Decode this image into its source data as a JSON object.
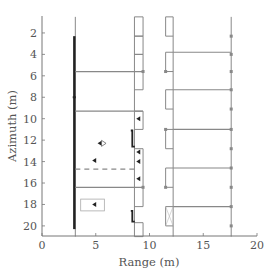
{
  "chart_data": {
    "type": "diagram",
    "title": "",
    "xlabel": "Range (m)",
    "ylabel": "Azimuth (m)",
    "xlim": [
      0,
      20
    ],
    "ylim": [
      21,
      0.5
    ],
    "y_inverted": true,
    "x_ticks": [
      0,
      5,
      10,
      15,
      20
    ],
    "y_ticks": [
      2,
      4,
      6,
      8,
      10,
      12,
      14,
      16,
      18,
      20
    ],
    "grid": false,
    "colors": {
      "structure": "#888888",
      "highlight": "#222222",
      "axis": "#777777",
      "text": "#555555"
    },
    "structures": {
      "left_wall": {
        "x": 3.1,
        "y_range": [
          0.5,
          21
        ],
        "thick_segment_y": [
          2.3,
          20.3
        ]
      },
      "middle_wall_inner": {
        "x": 8.6
      },
      "middle_wall_outer": {
        "x": 9.4
      },
      "bumps_middle": [
        {
          "y": [
            0.5,
            2.3
          ],
          "x": [
            8.6,
            9.4
          ]
        },
        {
          "y": [
            2.3,
            4.0
          ],
          "x": [
            8.6,
            9.4
          ]
        },
        {
          "y": [
            4.0,
            7.3
          ],
          "x": [
            8.6,
            9.4
          ]
        },
        {
          "y": [
            9.3,
            11.0
          ],
          "x": [
            8.6,
            9.4
          ]
        },
        {
          "y": [
            12.8,
            18.2
          ],
          "x": [
            8.6,
            9.4
          ]
        },
        {
          "y": [
            19.7,
            21.0
          ],
          "x": [
            8.6,
            9.4
          ]
        }
      ],
      "right_inner_wall": {
        "x": 12.2
      },
      "bumps_right_inner": [
        {
          "y": [
            0.5,
            2.3
          ],
          "x": [
            11.5,
            12.2
          ]
        },
        {
          "y": [
            3.8,
            5.6
          ],
          "x": [
            11.5,
            12.2
          ]
        },
        {
          "y": [
            7.3,
            9.1
          ],
          "x": [
            11.5,
            12.2
          ]
        },
        {
          "y": [
            11.0,
            12.8
          ],
          "x": [
            11.5,
            12.2
          ]
        },
        {
          "y": [
            14.6,
            16.4
          ],
          "x": [
            11.5,
            12.2
          ]
        },
        {
          "y": [
            18.2,
            20.0
          ],
          "x": [
            11.5,
            12.2
          ],
          "crossed": true
        }
      ],
      "right_outer_wall": {
        "x": 17.6,
        "markers_y": [
          2.3,
          4.0,
          5.6,
          7.3,
          9.1,
          11.0,
          12.8,
          14.6,
          16.4,
          18.2,
          20.0
        ]
      },
      "horizontal_lines_left": [
        {
          "y": 5.6,
          "x": [
            3.1,
            9.4
          ],
          "style": "solid"
        },
        {
          "y": 9.3,
          "x": [
            3.1,
            9.4
          ],
          "style": "solid"
        },
        {
          "y": 14.7,
          "x": [
            3.1,
            8.6
          ],
          "style": "dashed"
        },
        {
          "y": 16.4,
          "x": [
            3.1,
            9.4
          ],
          "style": "solid"
        }
      ],
      "horizontal_lines_right": [
        {
          "y": 3.8,
          "x": [
            12.2,
            17.6
          ]
        },
        {
          "y": 7.3,
          "x": [
            12.2,
            17.6
          ]
        },
        {
          "y": 11.0,
          "x": [
            12.2,
            17.6
          ]
        },
        {
          "y": 14.6,
          "x": [
            12.2,
            17.6
          ]
        },
        {
          "y": 18.2,
          "x": [
            12.2,
            17.6
          ]
        }
      ],
      "rectangle_box": {
        "x": [
          3.6,
          5.8
        ],
        "y": [
          17.5,
          18.6
        ]
      },
      "targets": [
        {
          "x": 5.4,
          "y": 12.3,
          "symbol": "triangle-with-outline"
        },
        {
          "x": 4.9,
          "y": 13.9,
          "symbol": "triangle"
        },
        {
          "x": 4.9,
          "y": 18.0,
          "symbol": "triangle"
        },
        {
          "x": 9.0,
          "y": 10.0,
          "symbol": "triangle"
        },
        {
          "x": 9.0,
          "y": 13.1,
          "symbol": "triangle"
        },
        {
          "x": 9.0,
          "y": 14.0,
          "symbol": "triangle"
        },
        {
          "x": 9.0,
          "y": 15.6,
          "symbol": "triangle"
        },
        {
          "x": 3.0,
          "y": 8.0,
          "symbol": "dot"
        }
      ],
      "hooks": [
        {
          "x": 8.4,
          "y": [
            11.1,
            12.6
          ]
        },
        {
          "x": 8.4,
          "y": [
            18.6,
            19.6
          ]
        }
      ]
    }
  },
  "axes": {
    "xlabel": "Range (m)",
    "ylabel": "Azimuth (m)",
    "x_tick_labels": [
      "0",
      "5",
      "10",
      "15",
      "20"
    ],
    "y_tick_labels": [
      "2",
      "4",
      "6",
      "8",
      "10",
      "12",
      "14",
      "16",
      "18",
      "20"
    ]
  }
}
